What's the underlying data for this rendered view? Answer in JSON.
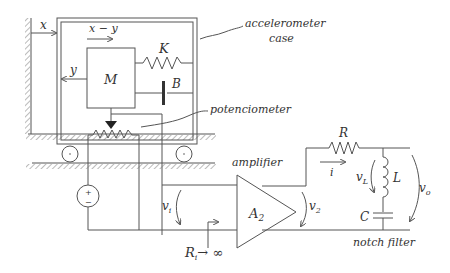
{
  "diagram": {
    "labels": {
      "x": "x",
      "x_minus_y": "x − y",
      "y": "y",
      "mass": "M",
      "spring": "K",
      "damper": "B",
      "case_line1": "accelerometer",
      "case_line2": "case",
      "potentiometer": "potenciometer",
      "amplifier": "amplifier",
      "amplifier_gain": "A",
      "amplifier_gain_sub": "2",
      "vi": "v",
      "vi_sub": "i",
      "v2": "v",
      "v2_sub": "2",
      "input_resistance": "R",
      "input_resistance_sub": "i",
      "input_resistance_limit": "→ ∞",
      "resistor": "R",
      "current": "i",
      "vL": "v",
      "vL_sub": "L",
      "inductor": "L",
      "capacitor": "C",
      "vo": "v",
      "vo_sub": "o",
      "notch_filter": "notch filter",
      "plus": "+",
      "minus": "−"
    },
    "colors": {
      "line": "#555555",
      "text": "#333333",
      "background": "#ffffff"
    }
  }
}
